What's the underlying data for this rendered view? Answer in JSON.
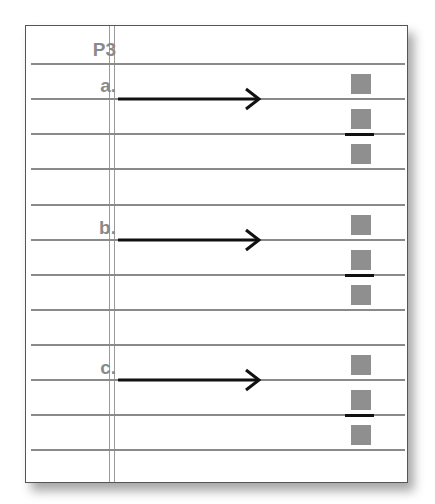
{
  "worksheet": {
    "title": "P3",
    "problems": [
      {
        "label": "a.",
        "arrow": "right-arrow",
        "answer_boxes": [
          "",
          "",
          ""
        ]
      },
      {
        "label": "b.",
        "arrow": "right-arrow",
        "answer_boxes": [
          "",
          "",
          ""
        ]
      },
      {
        "label": "c.",
        "arrow": "right-arrow",
        "answer_boxes": [
          "",
          "",
          ""
        ]
      }
    ]
  },
  "colors": {
    "rule_line": "#8a8a8a",
    "label_text": "#8a8a8a",
    "answer_box": "#8f8f8f",
    "arrow": "#111111",
    "border": "#555555"
  }
}
